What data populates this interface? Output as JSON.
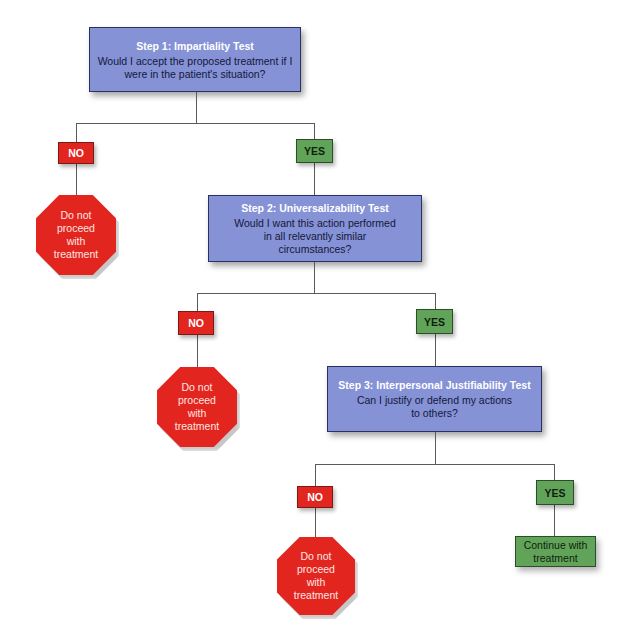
{
  "colors": {
    "step_fill": "#8592d6",
    "no_fill": "#e2251f",
    "yes_fill": "#62a35a",
    "connector": "#5a5a5a"
  },
  "steps": [
    {
      "title": "Step 1: Impartiality Test",
      "question": "Would I accept the proposed treatment if I\nwere in the patient's situation?"
    },
    {
      "title": "Step 2: Universalizability Test",
      "question": "Would I want this action performed\nin all relevantly similar\ncircumstances?"
    },
    {
      "title": "Step 3: Interpersonal Justifiability Test",
      "question": "Can I justify or defend my actions\nto others?"
    }
  ],
  "branches": [
    {
      "no_label": "NO",
      "yes_label": "YES",
      "no_outcome": "Do not\nproceed\nwith\ntreatment"
    },
    {
      "no_label": "NO",
      "yes_label": "YES",
      "no_outcome": "Do not\nproceed\nwith\ntreatment"
    },
    {
      "no_label": "NO",
      "yes_label": "YES",
      "no_outcome": "Do not\nproceed\nwith\ntreatment",
      "yes_outcome": "Continue with\ntreatment"
    }
  ]
}
